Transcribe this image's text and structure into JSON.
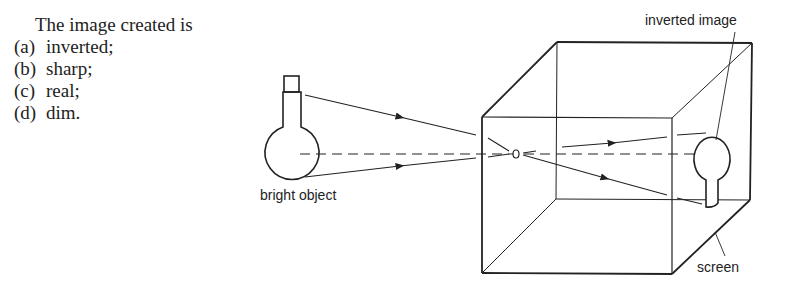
{
  "question": {
    "stem": "The image created is",
    "options": [
      {
        "label": "(a)",
        "text": "inverted;"
      },
      {
        "label": "(b)",
        "text": "sharp;"
      },
      {
        "label": "(c)",
        "text": "real;"
      },
      {
        "label": "(d)",
        "text": "dim."
      }
    ]
  },
  "diagram": {
    "labels": {
      "object": "bright object",
      "image": "inverted image",
      "screen": "screen"
    },
    "colors": {
      "line": "#222222",
      "background": "#ffffff"
    }
  }
}
